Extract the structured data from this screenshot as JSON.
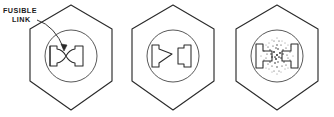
{
  "figure": {
    "background_color": "#ffffff",
    "line_color": "#2b2b2b",
    "annotation": {
      "label_line_1": "FUSIBLE",
      "label_line_2": "LINK",
      "leader_target": "fusible-link-element-of-first-fuse"
    },
    "panels": [
      {
        "id": "panel-1",
        "state": "intact",
        "caption": "",
        "fuse": {
          "link_shape": "hourglass-waist",
          "broken": false,
          "particles": false
        }
      },
      {
        "id": "panel-2",
        "state": "blown-open",
        "caption": "",
        "fuse": {
          "link_shape": "tapered-gap",
          "broken": true,
          "particles": false
        }
      },
      {
        "id": "panel-3",
        "state": "vaporized",
        "caption": "",
        "fuse": {
          "link_shape": "scattered-spray",
          "broken": true,
          "particles": true
        }
      }
    ]
  }
}
